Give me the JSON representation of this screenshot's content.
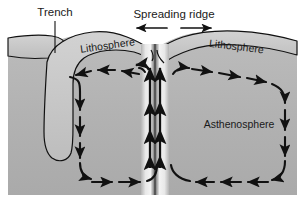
{
  "figure": {
    "background_color": "#ffffff",
    "mantle_color": "#b4b4b4",
    "lithosphere_color": "#c8c8c8",
    "line_color": "#111111",
    "ridge_plume_color": "#2b2b2b"
  },
  "labels": {
    "trench": "Trench",
    "spreading_ridge": "Spreading ridge",
    "lithosphere_left": "Lithosphere",
    "lithosphere_right": "Lithosphere",
    "asthenosphere": "Asthenosphere"
  },
  "annotations": {
    "trench_leader_line": "leader-line-from-trench-label-to-trench",
    "spreading_arrows": [
      {
        "name": "spreading-arrow-left",
        "direction": "left"
      },
      {
        "name": "spreading-arrow-right",
        "direction": "right"
      }
    ]
  },
  "flow": {
    "left_cell": {
      "name": "left-convection-cell",
      "direction": "counterclockwise",
      "arrow_count": 11
    },
    "right_cell": {
      "name": "right-convection-cell",
      "direction": "clockwise",
      "arrow_count": 11
    },
    "central_upwelling": {
      "name": "central-upwelling",
      "direction": "up",
      "column_count": 2,
      "arrowheads_per_column": 4
    }
  },
  "features": {
    "subducting_slab": "subducting-slab",
    "trench_notch": "trench-notch",
    "ridge_axis": "ridge-axis"
  }
}
